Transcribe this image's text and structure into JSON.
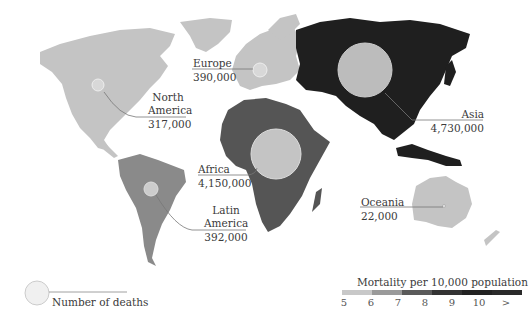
{
  "map": {
    "type": "choropleth-with-proportional-symbols",
    "fill_colors": {
      "scale_5_6": "#c4c4c4",
      "scale_6_7": "#8a8a8a",
      "scale_7_8": "#555555",
      "scale_8_9": "#2e2e2e",
      "scale_9_10": "#1f1f1f",
      "scale_gt_10": "#3a3a3a",
      "circle_fill": "#cfcfcf",
      "circle_stroke": "#e8e8e8",
      "leader_line": "#777777"
    },
    "regions": [
      {
        "name_line1": "North",
        "name_line2": "America",
        "deaths": "317,000"
      },
      {
        "name_line1": "Europe",
        "deaths": "390,000"
      },
      {
        "name_line1": "Asia",
        "deaths": "4,730,000"
      },
      {
        "name_line1": "Africa",
        "deaths": "4,150,000"
      },
      {
        "name_line1": "Latin",
        "name_line2": "America",
        "deaths": "392,000"
      },
      {
        "name_line1": "Oceania",
        "deaths": "22,000"
      }
    ]
  },
  "legend": {
    "circle_label": "Number of deaths",
    "scale_title": "Mortality per 10,000 population",
    "scale_ticks": [
      "5",
      "6",
      "7",
      "8",
      "9",
      "10",
      ">"
    ],
    "scale_colors": [
      "#c8c8c8",
      "#9a9a9a",
      "#5a5a5a",
      "#333333",
      "#222222",
      "#2a2a2a"
    ]
  }
}
